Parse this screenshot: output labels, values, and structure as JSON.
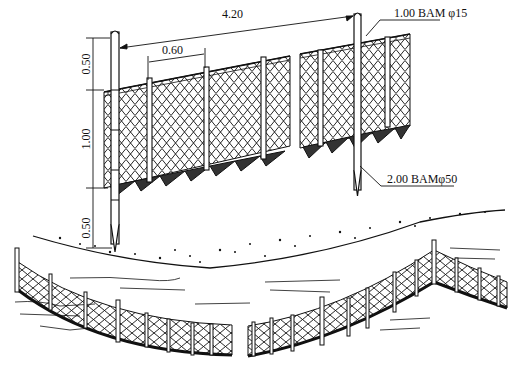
{
  "figure": {
    "dimensions": {
      "post_spacing_main": "4.20",
      "post_spacing_intermediate": "0.60",
      "height_above_net": "0.50",
      "net_height": "1.00",
      "embedment_depth": "0.50"
    },
    "callouts": {
      "intermediate_post": "1.00 BAM φ15",
      "main_post": "2.00 BAMφ50"
    },
    "colors": {
      "ink": "#111111",
      "paper": "#ffffff"
    }
  }
}
